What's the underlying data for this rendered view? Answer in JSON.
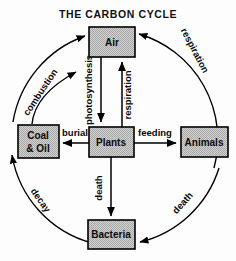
{
  "diagram": {
    "title": "THE CARBON CYCLE",
    "background_color": "#fdfdfd",
    "box_fill_color": "#cfcfcf",
    "line_color": "#000000",
    "nodes": [
      {
        "id": "air",
        "label": "Air",
        "label_line2": "",
        "x": 89,
        "y": 27,
        "w": 46,
        "h": 30
      },
      {
        "id": "coal",
        "label": "Coal",
        "label_line2": "& Oil",
        "x": 18,
        "y": 125,
        "w": 41,
        "h": 33
      },
      {
        "id": "plants",
        "label": "Plants",
        "label_line2": "",
        "x": 89,
        "y": 127,
        "w": 45,
        "h": 30
      },
      {
        "id": "animals",
        "label": "Animals",
        "label_line2": "",
        "x": 181,
        "y": 127,
        "w": 47,
        "h": 30
      },
      {
        "id": "bacteria",
        "label": "Bacteria",
        "label_line2": "",
        "x": 88,
        "y": 220,
        "w": 47,
        "h": 29
      }
    ],
    "straight_edges": [
      {
        "id": "photosynthesis",
        "label": "photosynthesis",
        "from": "air",
        "to": "plants",
        "direction": "down"
      },
      {
        "id": "respiration-plants",
        "label": "respiration",
        "from": "plants",
        "to": "air",
        "direction": "up"
      },
      {
        "id": "burial",
        "label": "burial",
        "from": "plants",
        "to": "coal",
        "direction": "left"
      },
      {
        "id": "feeding",
        "label": "feeding",
        "from": "plants",
        "to": "animals",
        "direction": "right"
      },
      {
        "id": "death-plants",
        "label": "death",
        "from": "plants",
        "to": "bacteria",
        "direction": "down"
      }
    ],
    "arc_edges": [
      {
        "id": "respiration-animals",
        "label": "respiration",
        "from": "animals",
        "to": "air",
        "side": "top-right"
      },
      {
        "id": "combustion",
        "label": "combustion",
        "from": "coal",
        "to": "air",
        "side": "top-left"
      },
      {
        "id": "decay",
        "label": "decay",
        "from": "bacteria",
        "to": "coal",
        "side": "bottom-left"
      },
      {
        "id": "death-animals",
        "label": "death",
        "from": "animals",
        "to": "bacteria",
        "side": "bottom-right"
      }
    ],
    "circle": {
      "cx": 118,
      "cy": 140,
      "r": 110
    }
  }
}
